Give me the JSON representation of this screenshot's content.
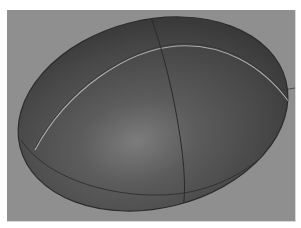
{
  "viewport": {
    "background_color": "#8f8f8f",
    "object": {
      "shape": "ellipsoid",
      "icon": "egg-ellipsoid-render",
      "body_color": "#4a4a4a",
      "highlight_color": "#7a7a7a",
      "seam_highlight_color": "#c8c8c8",
      "wire_color": "#2a2a2a"
    }
  }
}
